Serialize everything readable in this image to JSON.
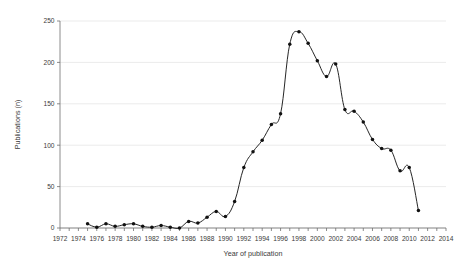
{
  "chart_data": {
    "type": "line",
    "title": "",
    "subtitle": "",
    "xlabel": "Year of publication",
    "ylabel": "Publications (n)",
    "xlim": [
      1972,
      2014
    ],
    "ylim": [
      0,
      250
    ],
    "grid": true,
    "legend": false,
    "legend_position": "none",
    "x_tick_labels": [
      "1972",
      "1974",
      "1976",
      "1978",
      "1980",
      "1982",
      "1984",
      "1986",
      "1988",
      "1990",
      "1992",
      "1994",
      "1996",
      "1998",
      "2000",
      "2002",
      "2004",
      "2006",
      "2008",
      "2010",
      "2012",
      "2014"
    ],
    "x_tick_values": [
      1972,
      1974,
      1976,
      1978,
      1980,
      1982,
      1984,
      1986,
      1988,
      1990,
      1992,
      1994,
      1996,
      1998,
      2000,
      2002,
      2004,
      2006,
      2008,
      2010,
      2012,
      2014
    ],
    "x_minor_tick_step": 1,
    "y_tick_labels": [
      "0",
      "50",
      "100",
      "150",
      "200",
      "250"
    ],
    "y_tick_values": [
      0,
      50,
      100,
      150,
      200,
      250
    ],
    "marker": "filled-circle",
    "line_color": "#1a1a1a",
    "marker_color": "#111111",
    "grid_color": "#e3e3e3",
    "axis_color": "#6e6e6e",
    "background_color": "#ffffff",
    "series": [
      {
        "name": "Publications",
        "x": [
          1975,
          1976,
          1977,
          1978,
          1979,
          1980,
          1981,
          1982,
          1983,
          1984,
          1985,
          1986,
          1987,
          1988,
          1989,
          1990,
          1991,
          1992,
          1993,
          1994,
          1995,
          1996,
          1997,
          1998,
          1999,
          2000,
          2001,
          2002,
          2003,
          2004,
          2005,
          2006,
          2007,
          2008,
          2009,
          2010,
          2011
        ],
        "values": [
          5,
          1,
          5,
          2,
          4,
          5,
          2,
          1,
          3,
          1,
          0,
          8,
          6,
          13,
          20,
          14,
          32,
          73,
          92,
          106,
          125,
          138,
          222,
          237,
          223,
          202,
          183,
          198,
          143,
          141,
          128,
          107,
          96,
          94,
          69,
          73,
          21
        ]
      }
    ]
  }
}
